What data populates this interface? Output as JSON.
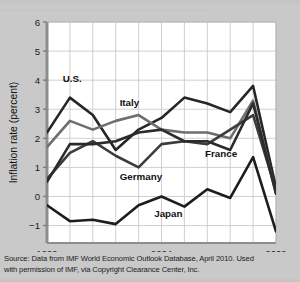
{
  "figure": {
    "background_color": "#c9c9c9",
    "plot_background_color": "#ffffff",
    "grid_color": "#c4c4c4",
    "axis_color": "#9a9a9a"
  },
  "source_note": {
    "line1": "Source: Data from IMF World Economic Outlook Database, April 2010. Used",
    "line2": "with permission of IMF, via Copyright Clearance Center, Inc."
  },
  "chart_data": {
    "type": "line",
    "title": "",
    "xlabel": "",
    "ylabel": "Inflation rate (percent)",
    "x": [
      1999,
      2000,
      2001,
      2002,
      2003,
      2004,
      2005,
      2006,
      2007,
      2008,
      2009
    ],
    "xlim": [
      1999,
      2009
    ],
    "ylim": [
      -1.6,
      6
    ],
    "xticks": [
      1999,
      2004,
      2009
    ],
    "xtick_labels": [
      "1999",
      "2004",
      "2009"
    ],
    "yticks": [
      -1,
      0,
      1,
      2,
      3,
      4,
      5,
      6
    ],
    "ytick_labels": [
      "−1",
      "0",
      "1",
      "2",
      "3",
      "4",
      "5",
      "6"
    ],
    "grid": true,
    "legend": "inline-labels",
    "series": [
      {
        "name": "U.S.",
        "color": "#262626",
        "width": 2.6,
        "label_x": 2000.1,
        "label_y": 3.95,
        "values": [
          2.2,
          3.4,
          2.8,
          1.6,
          2.3,
          2.7,
          3.4,
          3.2,
          2.9,
          3.8,
          0.3
        ]
      },
      {
        "name": "Italy",
        "color": "#6e6e6e",
        "width": 2.6,
        "label_x": 2002.6,
        "label_y": 3.1,
        "values": [
          1.7,
          2.6,
          2.3,
          2.6,
          2.8,
          2.3,
          2.2,
          2.2,
          2.0,
          3.3,
          0.1
        ]
      },
      {
        "name": "Germany",
        "color": "#3c3c3c",
        "width": 2.6,
        "label_x": 2003.1,
        "label_y": 0.55,
        "values": [
          0.6,
          1.5,
          1.9,
          1.4,
          1.0,
          1.8,
          1.9,
          1.8,
          2.3,
          2.8,
          0.2
        ]
      },
      {
        "name": "France",
        "color": "#2b2b2b",
        "width": 2.6,
        "label_x": 2006.6,
        "label_y": 1.35,
        "values": [
          0.5,
          1.8,
          1.8,
          1.9,
          2.2,
          2.3,
          1.9,
          1.9,
          1.6,
          3.2,
          0.1
        ]
      },
      {
        "name": "Japan",
        "color": "#1d1d1d",
        "width": 2.6,
        "label_x": 2004.3,
        "label_y": -0.72,
        "values": [
          -0.3,
          -0.85,
          -0.8,
          -0.95,
          -0.3,
          0.0,
          -0.35,
          0.25,
          -0.05,
          1.35,
          -1.2
        ]
      }
    ]
  }
}
